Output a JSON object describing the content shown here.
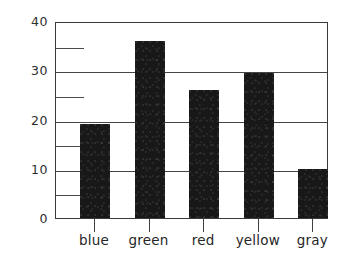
{
  "chart_data": {
    "type": "bar",
    "title": "",
    "xlabel": "",
    "ylabel": "",
    "categories": [
      "blue",
      "green",
      "red",
      "yellow",
      "gray"
    ],
    "values": [
      19,
      36,
      26,
      29.5,
      10
    ],
    "ylim": [
      0,
      40
    ],
    "y_major_ticks": [
      0,
      10,
      20,
      30,
      40
    ],
    "y_minor_ticks": [
      5,
      15,
      25,
      35
    ],
    "y_tick_labels": [
      "0",
      "10",
      "20",
      "30",
      "40"
    ],
    "grid": true,
    "legend": "none",
    "bar_color": "#181818",
    "axis_color": "#3a3a3a",
    "background_color": "#ffffff"
  }
}
